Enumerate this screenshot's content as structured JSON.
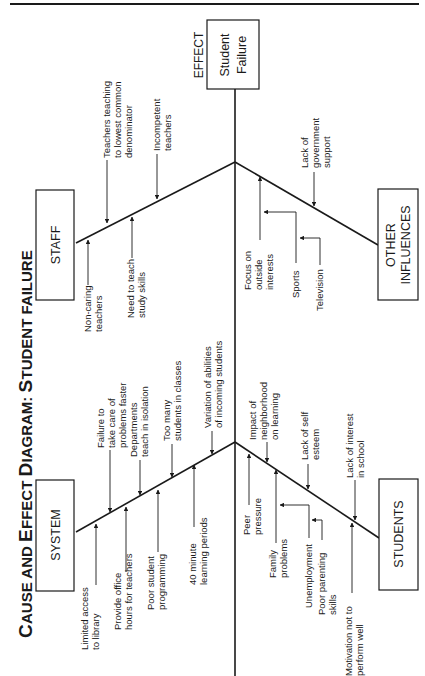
{
  "diagram": {
    "title": {
      "part1_big": "C",
      "part1_small": "AUSE AND ",
      "part2_big": "E",
      "part2_small": "FFECT ",
      "part3_big": "D",
      "part3_small": "IAGRAM: ",
      "part4_big": "S",
      "part4_small": "TUDENT FAILURE"
    },
    "effect": {
      "tag": "EFFECT",
      "line1": "Student",
      "line2": "Failure"
    },
    "categories": {
      "staff": {
        "label": "STAFF",
        "causes": [
          {
            "lines": [
              "Non-caring",
              "teachers"
            ]
          },
          {
            "lines": [
              "Need to teach",
              "study skills"
            ]
          },
          {
            "lines": [
              "Teachers teaching",
              "to lowest common",
              "denominator"
            ]
          },
          {
            "lines": [
              "Incompetent",
              "teachers"
            ]
          }
        ]
      },
      "other_influences": {
        "label_line1": "OTHER",
        "label_line2": "INFLUENCES",
        "causes": [
          {
            "lines": [
              "Focus on",
              "outside",
              "interests"
            ]
          },
          {
            "lines": [
              "Sports"
            ]
          },
          {
            "lines": [
              "Television"
            ]
          },
          {
            "lines": [
              "Lack of",
              "government",
              "support"
            ]
          }
        ]
      },
      "system": {
        "label": "SYSTEM",
        "causes": [
          {
            "lines": [
              "Limited access",
              "to library"
            ]
          },
          {
            "lines": [
              "Provide office",
              "hours for teachers"
            ]
          },
          {
            "lines": [
              "Failure to",
              "take care of",
              "problems faster"
            ]
          },
          {
            "lines": [
              "Poor student",
              "programming"
            ]
          },
          {
            "lines": [
              "Departments",
              "teach in isolation"
            ]
          },
          {
            "lines": [
              "Too many",
              "students in classes"
            ]
          },
          {
            "lines": [
              "40 minute",
              "learning periods"
            ]
          },
          {
            "lines": [
              "Variation of abilities",
              "of incoming students"
            ]
          }
        ]
      },
      "students": {
        "label": "STUDENTS",
        "causes": [
          {
            "lines": [
              "Peer",
              "pressure"
            ]
          },
          {
            "lines": [
              "Impact of",
              "neighborhood",
              "on learning"
            ]
          },
          {
            "lines": [
              "Family",
              "problems"
            ]
          },
          {
            "lines": [
              "Unemployment"
            ]
          },
          {
            "lines": [
              "Poor parenting",
              "skills"
            ]
          },
          {
            "lines": [
              "Lack of self",
              "esteem"
            ]
          },
          {
            "lines": [
              "Motivation not to",
              "perform well"
            ]
          },
          {
            "lines": [
              "Lack of interest",
              "in school"
            ]
          }
        ]
      }
    }
  }
}
